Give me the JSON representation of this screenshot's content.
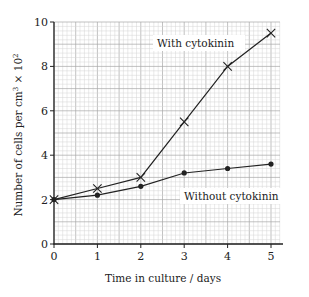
{
  "chart_data": {
    "type": "line",
    "title": "",
    "xlabel": "Time in culture / days",
    "ylabel": "Number of cells per cm³ × 10²",
    "x": [
      0,
      1,
      2,
      3,
      4,
      5
    ],
    "xlim": [
      0,
      5.2
    ],
    "ylim": [
      0,
      10
    ],
    "xticks": [
      "0",
      "1",
      "2",
      "3",
      "4",
      "5"
    ],
    "yticks": [
      "0",
      "2",
      "4",
      "6",
      "8",
      "10"
    ],
    "grid": true,
    "legend": "none (inline annotations)",
    "series": [
      {
        "name": "With cytokinin",
        "marker": "x",
        "values": [
          2,
          2.5,
          3,
          5.5,
          8,
          9.5
        ]
      },
      {
        "name": "Without cytokinin",
        "marker": "dot",
        "values": [
          2,
          2.2,
          2.6,
          3.2,
          3.4,
          3.6
        ]
      }
    ],
    "annotations": [
      {
        "text": "With cytokinin",
        "x": 2.6,
        "y": 9.1
      },
      {
        "text": "Without cytokinin",
        "x": 3.2,
        "y": 2.5
      }
    ]
  },
  "labels": {
    "xlabel": "Time in culture / days",
    "ylabel_prefix": "Number of cells per cm",
    "ylabel_sup1": "3",
    "ylabel_mid": " × 10",
    "ylabel_sup2": "2",
    "annot_with": "With cytokinin",
    "annot_without": "Without cytokinin"
  },
  "colors": {
    "line": "#222222",
    "grid_minor": "#d4d4d4",
    "grid_major": "#a8a8a8",
    "axis": "#222222"
  }
}
